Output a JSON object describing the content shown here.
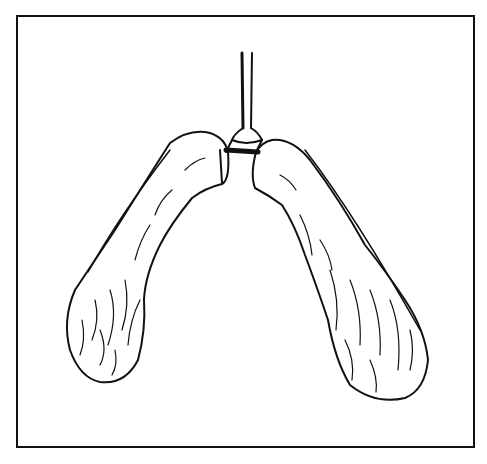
{
  "figure": {
    "line_color": "#111111",
    "background": "#ffffff"
  }
}
